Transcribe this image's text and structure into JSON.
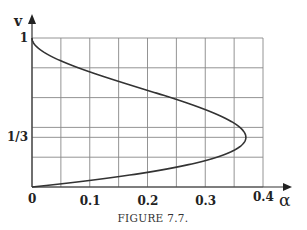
{
  "figure": {
    "caption": "FIGURE 7.7."
  },
  "chart_data": {
    "type": "line",
    "title": "",
    "caption": "FIGURE 7.7.",
    "xlabel": "α",
    "ylabel": "v",
    "xlim": [
      0,
      0.4
    ],
    "ylim": [
      0,
      1
    ],
    "x_ticks": [
      {
        "value": 0,
        "label": "0"
      },
      {
        "value": 0.1,
        "label": "0.1"
      },
      {
        "value": 0.2,
        "label": "0.2"
      },
      {
        "value": 0.3,
        "label": "0.3"
      },
      {
        "value": 0.4,
        "label": "0.4"
      }
    ],
    "y_ticks": [
      {
        "value": 0.3333,
        "label": "1/3"
      },
      {
        "value": 1,
        "label": "1"
      }
    ],
    "grid": true,
    "grid_x_step": 0.05,
    "grid_y_lines": [
      0,
      0.2,
      0.3333,
      0.4,
      0.6,
      0.8,
      1
    ],
    "series": [
      {
        "name": "v(α)",
        "description": "C-shaped curve from (0,1) to max α≈0.37 at v=1/3, back to (0,0)",
        "points": [
          {
            "v": 0.0,
            "alpha": 0.0
          },
          {
            "v": 0.02,
            "alpha": 0.048
          },
          {
            "v": 0.05,
            "alpha": 0.113
          },
          {
            "v": 0.1,
            "alpha": 0.203
          },
          {
            "v": 0.15,
            "alpha": 0.271
          },
          {
            "v": 0.2,
            "alpha": 0.32
          },
          {
            "v": 0.25,
            "alpha": 0.352
          },
          {
            "v": 0.3333,
            "alpha": 0.37
          },
          {
            "v": 0.4,
            "alpha": 0.36
          },
          {
            "v": 0.5,
            "alpha": 0.3125
          },
          {
            "v": 0.6,
            "alpha": 0.24
          },
          {
            "v": 0.7,
            "alpha": 0.158
          },
          {
            "v": 0.8,
            "alpha": 0.08
          },
          {
            "v": 0.9,
            "alpha": 0.0225
          },
          {
            "v": 1.0,
            "alpha": 0.0
          }
        ]
      }
    ],
    "annotations": []
  }
}
